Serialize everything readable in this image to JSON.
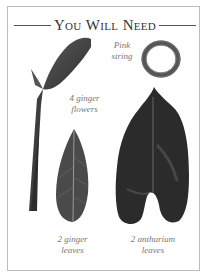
{
  "page": {
    "title": "You Will Need",
    "title_parts": [
      {
        "big": "Y",
        "small": "OU"
      },
      {
        "big": "W",
        "small": "ILL"
      },
      {
        "big": "N",
        "small": "EED"
      }
    ]
  },
  "items": [
    {
      "name": "ginger-flowers",
      "label_line1": "4 ginger",
      "label_line2": "flowers"
    },
    {
      "name": "pink-string",
      "label_line1": "Pink",
      "label_line2": "string"
    },
    {
      "name": "ginger-leaves",
      "label_line1": "2 ginger",
      "label_line2": "leaves"
    },
    {
      "name": "anthurium-leaves",
      "label_line1": "2 anthurium",
      "label_line2": "leaves"
    }
  ],
  "colors": {
    "border": "#bdbdbd",
    "text": "#333333",
    "label": "#777777",
    "leaf_dark": "#2a2a2a",
    "leaf_mid": "#4a4a4a"
  }
}
